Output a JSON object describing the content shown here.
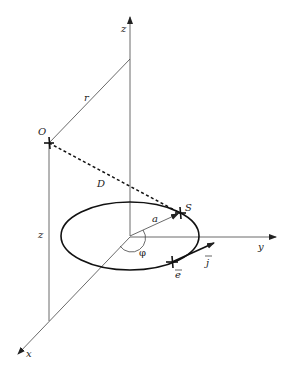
{
  "diagram": {
    "type": "3d-geometry",
    "axes": {
      "x": {
        "label": "x"
      },
      "y": {
        "label": "y"
      },
      "z": {
        "label": "z"
      }
    },
    "labels": {
      "origin_point": "O",
      "source_point": "S",
      "radius": "a",
      "distance": "D",
      "horizontal_distance": "r",
      "height": "z",
      "angle": "φ",
      "current_element": "e",
      "current_vector": "j"
    },
    "colors": {
      "line": "#444444",
      "loop": "#111111",
      "background": "#ffffff"
    }
  }
}
